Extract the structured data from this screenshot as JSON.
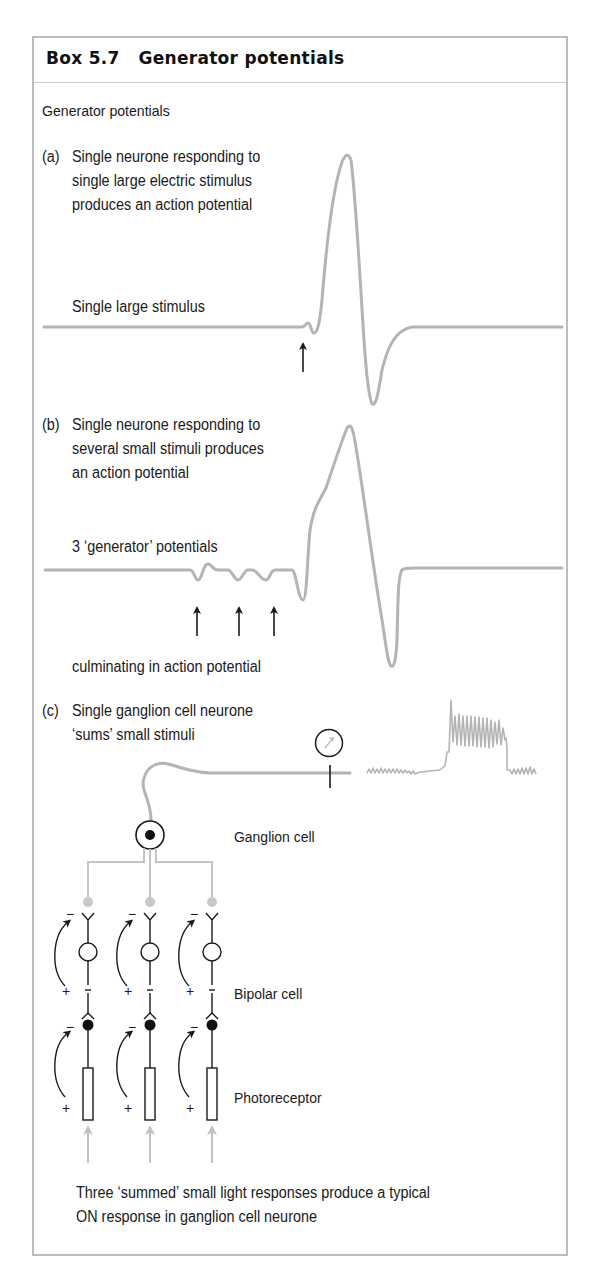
{
  "box": {
    "title": "Box 5.7   Generator potentials",
    "subheading": "Generator potentials"
  },
  "panel_a": {
    "letter": "(a)",
    "caption_lines": [
      "Single neurone responding to",
      "single large electric stimulus",
      "produces an action potential"
    ],
    "trace_label": "Single large stimulus",
    "stimulus_arrows": 1
  },
  "panel_b": {
    "letter": "(b)",
    "caption_lines": [
      "Single neurone responding to",
      "several small stimuli produces",
      "an action potential"
    ],
    "trace_label": "3 ‘generator’ potentials",
    "stimulus_arrows": 3,
    "below_label": "culminating in action potential"
  },
  "panel_c": {
    "letter": "(c)",
    "caption_lines": [
      "Single ganglion cell neurone",
      "‘sums’ small stimuli"
    ],
    "labels": {
      "ganglion": "Ganglion cell",
      "bipolar": "Bipolar cell",
      "photoreceptor": "Photoreceptor"
    },
    "columns": 3,
    "signs": {
      "minus": "−",
      "plus": "+"
    },
    "footer_lines": [
      "Three ‘summed’ small light responses produce a typical",
      "ON response in ganglion cell neurone"
    ]
  },
  "colors": {
    "trace": "#b4b4b4",
    "border": "#bdbdbd",
    "ink": "#1a1a1a",
    "gray_light": "#c8c8c8"
  }
}
